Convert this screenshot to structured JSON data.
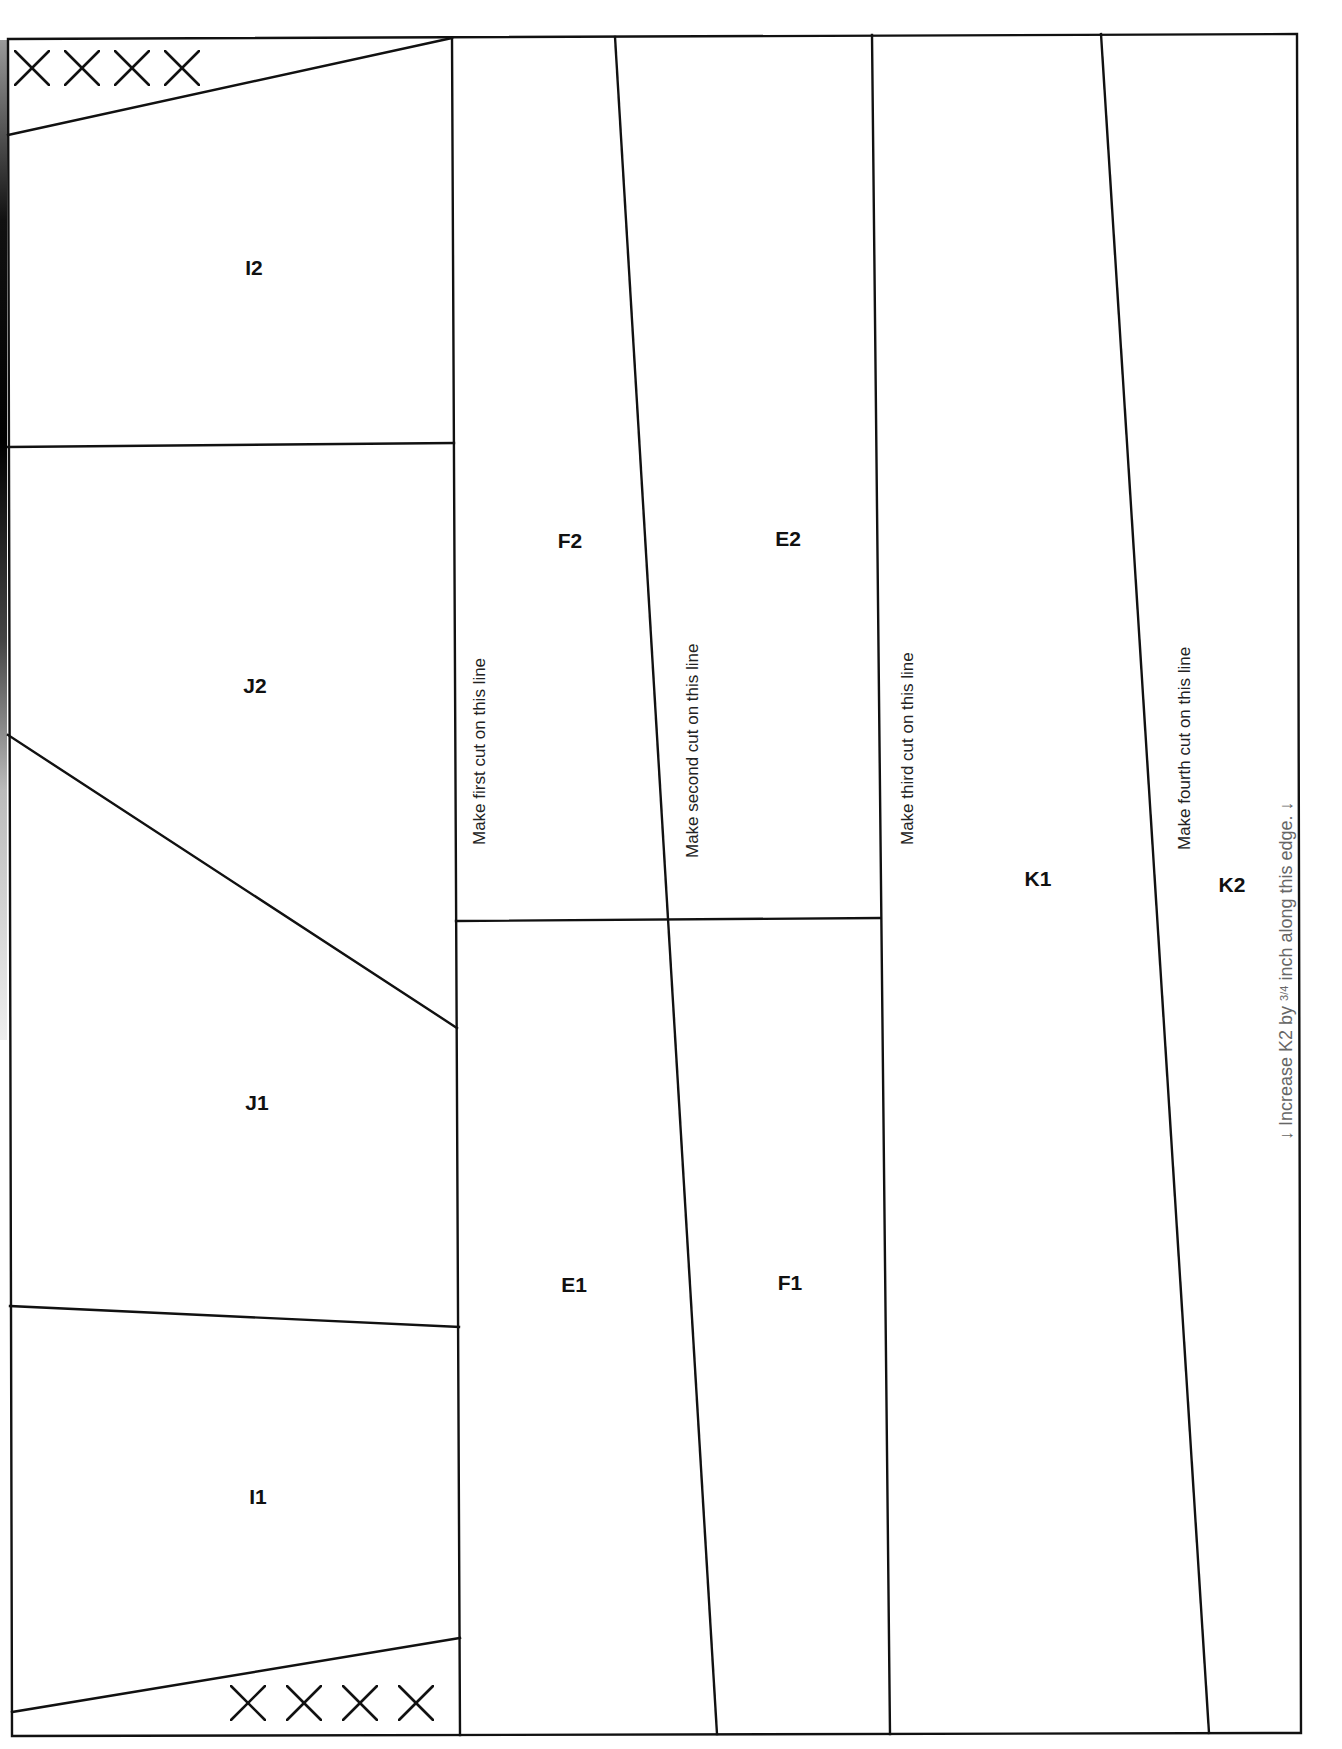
{
  "pattern": {
    "type": "foundation paper piecing template",
    "sections": [
      {
        "id": "I2",
        "label": "I2",
        "x": 254,
        "y": 268
      },
      {
        "id": "J2",
        "label": "J2",
        "x": 255,
        "y": 686
      },
      {
        "id": "J1",
        "label": "J1",
        "x": 257,
        "y": 1103
      },
      {
        "id": "I1",
        "label": "I1",
        "x": 258,
        "y": 1497
      },
      {
        "id": "F2",
        "label": "F2",
        "x": 570,
        "y": 541
      },
      {
        "id": "E2",
        "label": "E2",
        "x": 788,
        "y": 539
      },
      {
        "id": "E1",
        "label": "E1",
        "x": 574,
        "y": 1285
      },
      {
        "id": "F1",
        "label": "F1",
        "x": 790,
        "y": 1283
      },
      {
        "id": "K1",
        "label": "K1",
        "x": 1038,
        "y": 879
      },
      {
        "id": "K2",
        "label": "K2",
        "x": 1232,
        "y": 885
      }
    ],
    "cut_instructions": [
      {
        "id": "first",
        "text": "Make first cut on this line"
      },
      {
        "id": "second",
        "text": "Make second cut on this line"
      },
      {
        "id": "third",
        "text": "Make third cut on this line"
      },
      {
        "id": "fourth",
        "text": "Make fourth cut on this line"
      }
    ],
    "edge_note": {
      "arrow_left": "↓",
      "prefix": "Increase K2 by ",
      "fraction": "3/4",
      "suffix": " inch along this edge.",
      "arrow_right": "↓"
    },
    "discard_marks": {
      "top": {
        "symbol": "×",
        "count": 4
      },
      "bottom": {
        "symbol": "×",
        "count": 4
      }
    }
  },
  "colors": {
    "line": "#111111",
    "label": "#111111",
    "instruction": "#222222",
    "note": "#666666",
    "background": "#ffffff"
  }
}
